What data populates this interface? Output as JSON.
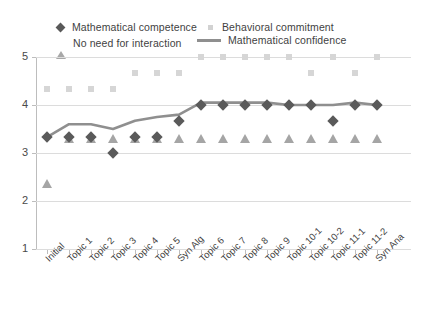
{
  "legend": {
    "items": [
      {
        "label": "Mathematical competence",
        "marker": "diamond-marker",
        "color": "#5a5a5a"
      },
      {
        "label": "No need for interaction",
        "marker": "triangle-marker",
        "color": "#a5a5a5"
      },
      {
        "label": "Behavioral commitment",
        "marker": "square-marker",
        "color": "#d6d6d6"
      },
      {
        "label": "Mathematical confidence",
        "marker": "line-marker",
        "color": "#8f8f8f"
      }
    ]
  },
  "axes": {
    "y_ticks": [
      "5",
      "4",
      "3",
      "2",
      "1"
    ],
    "x_ticks": [
      "Initial",
      "Topic 1",
      "Topic 2",
      "Topic 3",
      "Topic 4",
      "Topic 5",
      "Syn Alg",
      "Topic 6",
      "Topic 7",
      "Topic 8",
      "Topic 9",
      "Topic 10-1",
      "Topic 10-2",
      "Topic 11-1",
      "Topic 11-2",
      "Syn Ana"
    ]
  },
  "chart_data": {
    "type": "line",
    "title": "",
    "xlabel": "",
    "ylabel": "",
    "ylim": [
      1,
      5
    ],
    "grid": true,
    "legend_position": "top",
    "categories": [
      "Initial",
      "Topic 1",
      "Topic 2",
      "Topic 3",
      "Topic 4",
      "Topic 5",
      "Syn Alg",
      "Topic 6",
      "Topic 7",
      "Topic 8",
      "Topic 9",
      "Topic 10-1",
      "Topic 10-2",
      "Topic 11-1",
      "Topic 11-2",
      "Syn Ana"
    ],
    "series": [
      {
        "name": "Mathematical competence",
        "marker": "diamond",
        "color": "#5a5a5a",
        "values": [
          3.33,
          3.33,
          3.33,
          3.0,
          3.33,
          3.33,
          3.67,
          4.0,
          4.0,
          4.0,
          4.0,
          4.0,
          4.0,
          3.67,
          4.0,
          4.0
        ]
      },
      {
        "name": "No need for interaction",
        "marker": "triangle",
        "color": "#a5a5a5",
        "values": [
          2.35,
          3.3,
          3.3,
          3.3,
          3.3,
          3.3,
          3.3,
          3.3,
          3.3,
          3.3,
          3.3,
          3.3,
          3.3,
          3.3,
          3.3,
          3.3
        ]
      },
      {
        "name": "Behavioral commitment",
        "marker": "square",
        "color": "#d6d6d6",
        "values": [
          4.33,
          4.33,
          4.33,
          4.33,
          4.67,
          4.67,
          4.67,
          5.0,
          5.0,
          5.0,
          5.0,
          5.0,
          4.67,
          5.0,
          4.67,
          5.0
        ]
      },
      {
        "name": "Mathematical confidence",
        "marker": "line",
        "color": "#8f8f8f",
        "values": [
          3.33,
          3.6,
          3.6,
          3.5,
          3.67,
          3.75,
          3.8,
          4.05,
          4.05,
          4.05,
          4.05,
          4.0,
          4.0,
          4.0,
          4.05,
          4.0
        ]
      }
    ]
  }
}
